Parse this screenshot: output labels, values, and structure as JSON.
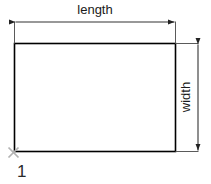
{
  "diagram": {
    "type": "technical-dimension-drawing",
    "shape": "rectangle",
    "background_color": "#ffffff",
    "shape_outline_color": "#000000",
    "dimension_line_color": "#333333",
    "marker_color": "#b0b0b0",
    "label_color": "#1a1a1a",
    "labels": {
      "length": "length",
      "width": "width",
      "origin_point": "1"
    },
    "annotations": {
      "origin_marker_icon": "x-marker-icon",
      "length_dimension_name": "length-dimension",
      "width_dimension_name": "width-dimension"
    }
  }
}
